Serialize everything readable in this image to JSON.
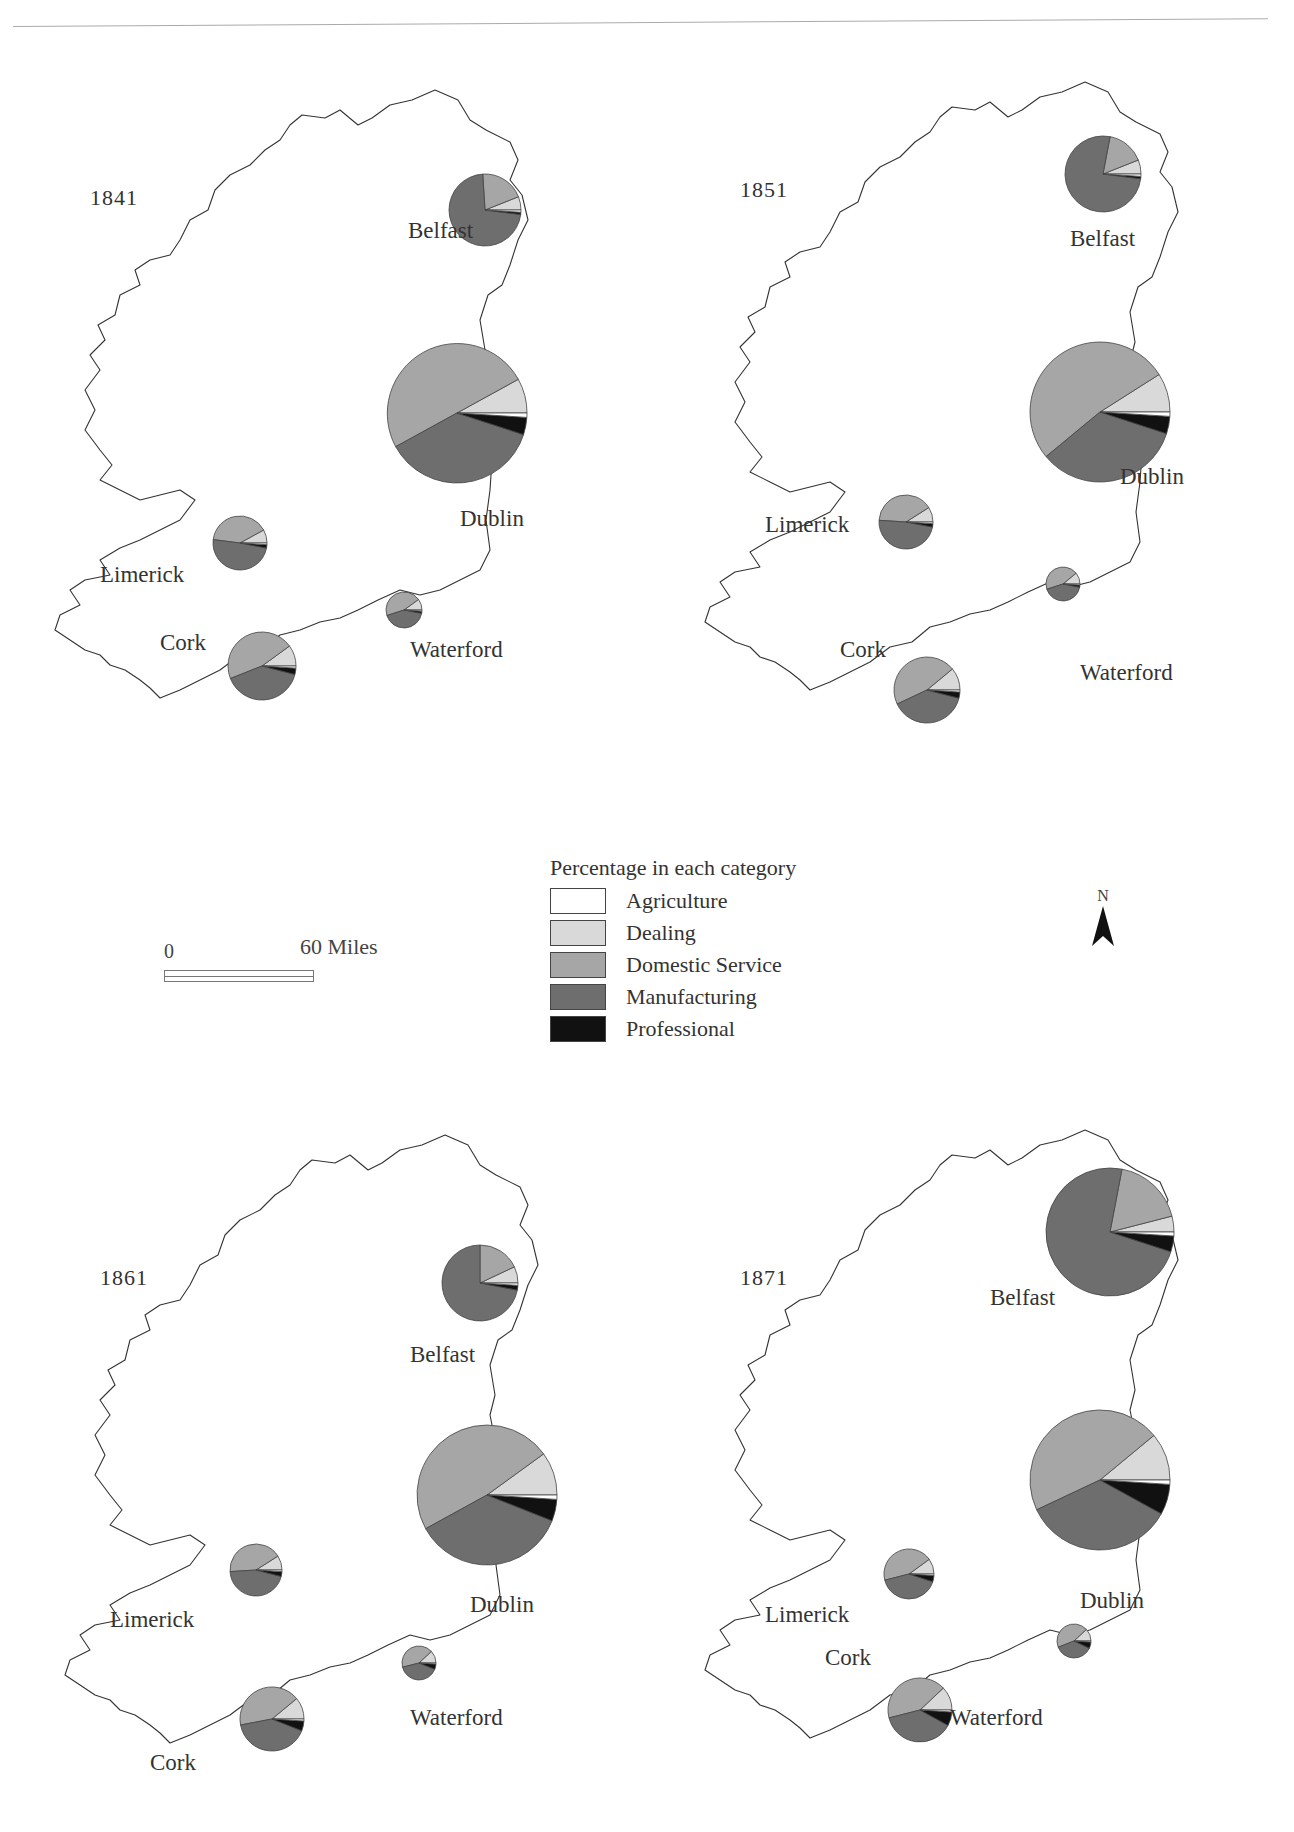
{
  "figure": {
    "legend": {
      "title": "Percentage in each category",
      "items": [
        {
          "label": "Agriculture",
          "color": "#ffffff"
        },
        {
          "label": "Dealing",
          "color": "#d9d9d9"
        },
        {
          "label": "Domestic Service",
          "color": "#a6a6a6"
        },
        {
          "label": "Manufacturing",
          "color": "#6e6e6e"
        },
        {
          "label": "Professional",
          "color": "#111111"
        }
      ]
    },
    "scale_bar": {
      "start_label": "0",
      "end_label": "60 Miles"
    },
    "north_arrow": {
      "label": "N"
    },
    "panels": [
      {
        "year": "1841"
      },
      {
        "year": "1851"
      },
      {
        "year": "1861"
      },
      {
        "year": "1871"
      }
    ]
  },
  "chart_data": {
    "type": "pie",
    "title": "Percentage in each category",
    "categories": [
      "Agriculture",
      "Dealing",
      "Domestic Service",
      "Manufacturing",
      "Professional"
    ],
    "note": "Proportional pie charts (area ~ size) of occupational categories for five Irish cities, by census year",
    "maps": [
      {
        "year": "1841",
        "cities": [
          {
            "name": "Belfast",
            "radius": 36,
            "values": {
              "Agriculture": 1,
              "Dealing": 6,
              "Domestic Service": 20,
              "Manufacturing": 72,
              "Professional": 1
            }
          },
          {
            "name": "Dublin",
            "radius": 70,
            "values": {
              "Agriculture": 1,
              "Dealing": 8,
              "Domestic Service": 50,
              "Manufacturing": 37,
              "Professional": 4
            }
          },
          {
            "name": "Limerick",
            "radius": 27,
            "values": {
              "Agriculture": 1,
              "Dealing": 8,
              "Domestic Service": 40,
              "Manufacturing": 49,
              "Professional": 2
            }
          },
          {
            "name": "Cork",
            "radius": 34,
            "values": {
              "Agriculture": 1,
              "Dealing": 10,
              "Domestic Service": 46,
              "Manufacturing": 40,
              "Professional": 3
            }
          },
          {
            "name": "Waterford",
            "radius": 18,
            "values": {
              "Agriculture": 1,
              "Dealing": 10,
              "Domestic Service": 45,
              "Manufacturing": 42,
              "Professional": 2
            }
          }
        ]
      },
      {
        "year": "1851",
        "cities": [
          {
            "name": "Belfast",
            "radius": 38,
            "values": {
              "Agriculture": 1,
              "Dealing": 6,
              "Domestic Service": 16,
              "Manufacturing": 76,
              "Professional": 1
            }
          },
          {
            "name": "Dublin",
            "radius": 70,
            "values": {
              "Agriculture": 1,
              "Dealing": 9,
              "Domestic Service": 52,
              "Manufacturing": 34,
              "Professional": 4
            }
          },
          {
            "name": "Limerick",
            "radius": 27,
            "values": {
              "Agriculture": 1,
              "Dealing": 9,
              "Domestic Service": 40,
              "Manufacturing": 48,
              "Professional": 2
            }
          },
          {
            "name": "Cork",
            "radius": 33,
            "values": {
              "Agriculture": 1,
              "Dealing": 11,
              "Domestic Service": 46,
              "Manufacturing": 39,
              "Professional": 3
            }
          },
          {
            "name": "Waterford",
            "radius": 17,
            "values": {
              "Agriculture": 1,
              "Dealing": 11,
              "Domestic Service": 44,
              "Manufacturing": 42,
              "Professional": 2
            }
          }
        ]
      },
      {
        "year": "1861",
        "cities": [
          {
            "name": "Belfast",
            "radius": 38,
            "values": {
              "Agriculture": 1,
              "Dealing": 7,
              "Domestic Service": 18,
              "Manufacturing": 72,
              "Professional": 2
            }
          },
          {
            "name": "Dublin",
            "radius": 70,
            "values": {
              "Agriculture": 1,
              "Dealing": 10,
              "Domestic Service": 48,
              "Manufacturing": 36,
              "Professional": 5
            }
          },
          {
            "name": "Limerick",
            "radius": 26,
            "values": {
              "Agriculture": 1,
              "Dealing": 9,
              "Domestic Service": 42,
              "Manufacturing": 45,
              "Professional": 3
            }
          },
          {
            "name": "Cork",
            "radius": 32,
            "values": {
              "Agriculture": 1,
              "Dealing": 11,
              "Domestic Service": 42,
              "Manufacturing": 41,
              "Professional": 5
            }
          },
          {
            "name": "Waterford",
            "radius": 17,
            "values": {
              "Agriculture": 1,
              "Dealing": 12,
              "Domestic Service": 42,
              "Manufacturing": 40,
              "Professional": 5
            }
          }
        ]
      },
      {
        "year": "1871",
        "cities": [
          {
            "name": "Belfast",
            "radius": 64,
            "values": {
              "Agriculture": 1,
              "Dealing": 4,
              "Domestic Service": 18,
              "Manufacturing": 73,
              "Professional": 4
            }
          },
          {
            "name": "Dublin",
            "radius": 70,
            "values": {
              "Agriculture": 1,
              "Dealing": 11,
              "Domestic Service": 46,
              "Manufacturing": 35,
              "Professional": 7
            }
          },
          {
            "name": "Limerick",
            "radius": 25,
            "values": {
              "Agriculture": 1,
              "Dealing": 10,
              "Domestic Service": 44,
              "Manufacturing": 41,
              "Professional": 4
            }
          },
          {
            "name": "Cork",
            "radius": 32,
            "values": {
              "Agriculture": 1,
              "Dealing": 12,
              "Domestic Service": 42,
              "Manufacturing": 38,
              "Professional": 7
            }
          },
          {
            "name": "Waterford",
            "radius": 17,
            "values": {
              "Agriculture": 1,
              "Dealing": 12,
              "Domestic Service": 44,
              "Manufacturing": 37,
              "Professional": 6
            }
          }
        ]
      }
    ]
  }
}
